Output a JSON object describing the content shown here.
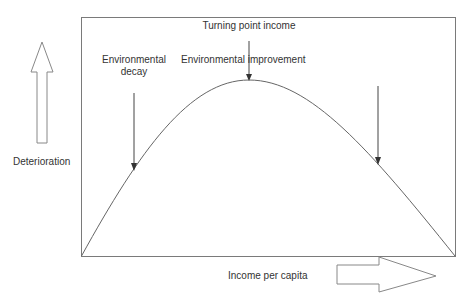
{
  "diagram": {
    "y_axis_label": "Deterioration",
    "x_axis_label": "Income per capita",
    "annotations": {
      "turning_point": "Turning point income",
      "left_phase_line1": "Environmental",
      "left_phase_line2": "decay",
      "right_phase": "Environmental improvement"
    },
    "colors": {
      "line": "#555555",
      "text": "#333333",
      "frame": "#777777"
    }
  }
}
